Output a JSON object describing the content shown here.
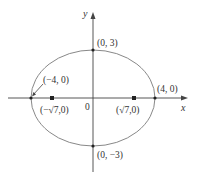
{
  "figure": {
    "type": "ellipse",
    "equation_hint": "x^2/16 + y^2/9 = 1",
    "colors": {
      "curve": "#888888",
      "axis": "#444444",
      "point": "#222222",
      "text": "#333333"
    }
  },
  "axes": {
    "x_label": "x",
    "y_label": "y",
    "origin_label": "0"
  },
  "points": {
    "top_vertex": {
      "label": "(0, 3)"
    },
    "bottom_vertex": {
      "label": "(0, −3)"
    },
    "left_vertex": {
      "label": "(−4, 0)"
    },
    "right_vertex": {
      "label": "(4, 0)"
    },
    "left_focus": {
      "label": "(−√7,0)"
    },
    "right_focus": {
      "label": "(√7,0)"
    }
  }
}
